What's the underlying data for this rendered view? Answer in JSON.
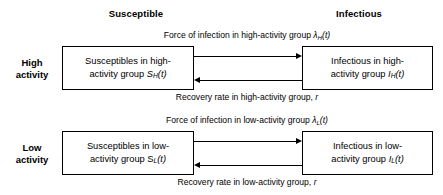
{
  "diagram": {
    "columns": {
      "susceptible": "Susceptible",
      "infectious": "Infectious"
    },
    "rows": {
      "high": {
        "line1": "High",
        "line2": "activity"
      },
      "low": {
        "line1": "Low",
        "line2": "activity"
      }
    },
    "boxes": {
      "susceptible_high": {
        "line1": "Susceptibles in high-",
        "line2_prefix": "activity group ",
        "symbol": "S",
        "subscript": "H",
        "suffix": "(t)"
      },
      "infectious_high": {
        "line1": "Infectious in high-",
        "line2_prefix": "activity group ",
        "symbol": "I",
        "subscript": "H",
        "suffix": "(t)"
      },
      "susceptible_low": {
        "line1": "Susceptibles in low-",
        "line2_prefix": "activity group ",
        "symbol": "S",
        "subscript": "L",
        "suffix": "(t)"
      },
      "infectious_low": {
        "line1": "Infectious in low-",
        "line2_prefix": "activity group ",
        "symbol": "I",
        "subscript": "L",
        "suffix": "(t)"
      }
    },
    "arrows": {
      "infection_high": {
        "caption_prefix": "Force of infection in high-activity group ",
        "symbol": "λ",
        "subscript": "H",
        "suffix": "(t)",
        "direction": "right"
      },
      "recovery_high": {
        "caption_prefix": "Recovery rate in high-activity group, ",
        "symbol": "r",
        "subscript": "",
        "suffix": "",
        "direction": "left"
      },
      "infection_low": {
        "caption_prefix": "Force of infection in low-activity group ",
        "symbol": "λ",
        "subscript": "L",
        "suffix": "(t)",
        "direction": "right"
      },
      "recovery_low": {
        "caption_prefix": "Recovery rate in low-activity group, ",
        "symbol": "r",
        "subscript": "",
        "suffix": "",
        "direction": "left"
      }
    },
    "colors": {
      "background": "#ffffff",
      "stroke": "#000000",
      "text": "#000000"
    }
  }
}
